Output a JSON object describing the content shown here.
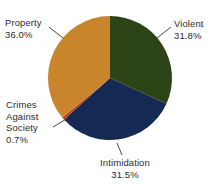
{
  "chart_data": {
    "type": "pie",
    "title": "",
    "subtitle": "",
    "xlabel": "",
    "ylabel": "",
    "legend_position": "none",
    "grid": false,
    "labels_outside": true,
    "start_angle_deg": 0,
    "direction": "clockwise",
    "categories": [
      "Violent",
      "Intimidation",
      "Crimes Against Society",
      "Property"
    ],
    "values": [
      31.8,
      31.5,
      0.7,
      36.0
    ],
    "value_suffix": "%",
    "slices": [
      {
        "name": "Violent",
        "label_lines": [
          "Violent"
        ],
        "value": 31.8,
        "value_text": "31.8%",
        "color": "#2d4416"
      },
      {
        "name": "Intimidation",
        "label_lines": [
          "Intimidation"
        ],
        "value": 31.5,
        "value_text": "31.5%",
        "color": "#152a52"
      },
      {
        "name": "Crimes Against Society",
        "label_lines": [
          "Crimes",
          "Against",
          "Society"
        ],
        "value": 0.7,
        "value_text": "0.7%",
        "color": "#c0441a"
      },
      {
        "name": "Property",
        "label_lines": [
          "Property"
        ],
        "value": 36.0,
        "value_text": "36.0%",
        "color": "#c8852c"
      }
    ]
  },
  "labels": {
    "violent": {
      "line1": "Violent",
      "value": "31.8%"
    },
    "intimidation": {
      "line1": "Intimidation",
      "value": "31.5%"
    },
    "crimes_against_society": {
      "line1": "Crimes",
      "line2": "Against",
      "line3": "Society",
      "value": "0.7%"
    },
    "property": {
      "line1": "Property",
      "value": "36.0%"
    }
  },
  "colors": {
    "violent": "#2d4416",
    "intimidation": "#152a52",
    "crimes_against_society": "#c0441a",
    "property": "#c8852c",
    "text": "#2b2b2b",
    "leader_line": "#4a4a4a",
    "background": "#ffffff"
  }
}
